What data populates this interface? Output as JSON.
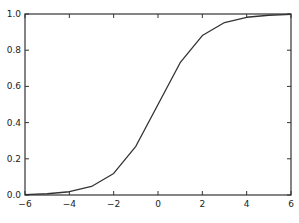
{
  "chart_data": {
    "type": "line",
    "title": "",
    "xlabel": "",
    "ylabel": "",
    "xlim": [
      -6,
      6
    ],
    "ylim": [
      0.0,
      1.0
    ],
    "grid": false,
    "legend": null,
    "x_ticks": [
      -6,
      -4,
      -2,
      0,
      2,
      4,
      6
    ],
    "x_tick_labels": [
      "−6",
      "−4",
      "−2",
      "0",
      "2",
      "4",
      "6"
    ],
    "y_ticks": [
      0.0,
      0.2,
      0.4,
      0.6,
      0.8,
      1.0
    ],
    "y_tick_labels": [
      "0.0",
      "0.2",
      "0.4",
      "0.6",
      "0.8",
      "1.0"
    ],
    "series": [
      {
        "name": "sigmoid",
        "color": "#333333",
        "x": [
          -6,
          -5,
          -4,
          -3,
          -2,
          -1,
          0,
          1,
          2,
          3,
          4,
          5,
          6
        ],
        "values": [
          0.002,
          0.007,
          0.018,
          0.047,
          0.119,
          0.269,
          0.5,
          0.731,
          0.881,
          0.953,
          0.982,
          0.993,
          0.998
        ]
      }
    ]
  }
}
